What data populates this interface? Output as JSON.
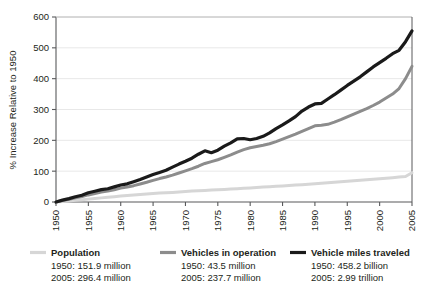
{
  "chart_data": {
    "type": "line",
    "title": "",
    "xlabel": "",
    "ylabel": "% Increase Relative to 1950",
    "xlim": [
      1950,
      2005
    ],
    "ylim": [
      0,
      600
    ],
    "ytick_values": [
      0,
      100,
      200,
      300,
      400,
      500,
      600
    ],
    "ytick_labels": [
      "0",
      "100",
      "200",
      "300",
      "400",
      "500",
      "600"
    ],
    "xtick_values": [
      1950,
      1955,
      1960,
      1965,
      1970,
      1975,
      1980,
      1985,
      1990,
      1995,
      2000,
      2005
    ],
    "xtick_labels": [
      "1950",
      "1955",
      "1960",
      "1965",
      "1970",
      "1975",
      "1980",
      "1985",
      "1990",
      "1995",
      "2000",
      "2005"
    ],
    "grid": "horizontal",
    "grid_color": "#e8e8e8",
    "legend_position": "below",
    "series": [
      {
        "name": "Population",
        "color": "#d6d6d6",
        "width": 3.0,
        "baseline_1950": "1950: 151.9 million",
        "final_2005": "2005: 296.4 million",
        "x": [
          1950,
          1951,
          1952,
          1953,
          1954,
          1955,
          1956,
          1957,
          1958,
          1959,
          1960,
          1961,
          1962,
          1963,
          1964,
          1965,
          1966,
          1967,
          1968,
          1969,
          1970,
          1971,
          1972,
          1973,
          1974,
          1975,
          1976,
          1977,
          1978,
          1979,
          1980,
          1981,
          1982,
          1983,
          1984,
          1985,
          1986,
          1987,
          1988,
          1989,
          1990,
          1991,
          1992,
          1993,
          1994,
          1995,
          1996,
          1997,
          1998,
          1999,
          2000,
          2001,
          2002,
          2003,
          2004,
          2005
        ],
        "values": [
          0,
          1.8,
          3.6,
          5.4,
          7.3,
          9.3,
          11.3,
          13.4,
          15.4,
          17.3,
          19.3,
          21.2,
          22.9,
          24.5,
          26.1,
          27.5,
          28.8,
          30.0,
          31.2,
          32.4,
          33.8,
          35.3,
          36.5,
          37.6,
          38.6,
          39.7,
          40.8,
          41.9,
          43.1,
          44.4,
          45.8,
          47.1,
          48.3,
          49.5,
          50.7,
          52.0,
          53.4,
          54.8,
          56.2,
          57.7,
          59.3,
          60.9,
          62.6,
          64.3,
          65.9,
          67.4,
          68.9,
          70.5,
          72.1,
          73.7,
          75.6,
          77.3,
          79.0,
          80.8,
          82.7,
          95.1
        ]
      },
      {
        "name": "Vehicles in operation",
        "color": "#8c8c8c",
        "width": 3.0,
        "baseline_1950": "1950: 43.5 million",
        "final_2005": "2005: 237.7 million",
        "x": [
          1950,
          1951,
          1952,
          1953,
          1954,
          1955,
          1956,
          1957,
          1958,
          1959,
          1960,
          1961,
          1962,
          1963,
          1964,
          1965,
          1966,
          1967,
          1968,
          1969,
          1970,
          1971,
          1972,
          1973,
          1974,
          1975,
          1976,
          1977,
          1978,
          1979,
          1980,
          1981,
          1982,
          1983,
          1984,
          1985,
          1986,
          1987,
          1988,
          1989,
          1990,
          1991,
          1992,
          1993,
          1994,
          1995,
          1996,
          1997,
          1998,
          1999,
          2000,
          2001,
          2002,
          2003,
          2004,
          2005
        ],
        "values": [
          0,
          5.0,
          9.0,
          13.5,
          17.5,
          23.0,
          27.5,
          32.0,
          35.5,
          40.0,
          45.0,
          48.5,
          53.0,
          58.5,
          64.0,
          70.0,
          76.0,
          81.0,
          87.0,
          94.0,
          101.0,
          108.0,
          116.0,
          125.0,
          131.0,
          137.0,
          145.0,
          153.0,
          162.0,
          170.0,
          176.0,
          180.0,
          184.0,
          189.0,
          196.0,
          204.0,
          212.0,
          220.0,
          229.0,
          238.0,
          247.0,
          249.0,
          252.0,
          259.0,
          267.0,
          276.0,
          285.0,
          294.0,
          303.0,
          313.0,
          324.0,
          337.0,
          350.0,
          368.0,
          400.0,
          440.0
        ]
      },
      {
        "name": "Vehicle miles traveled",
        "color": "#1a1a1a",
        "width": 3.2,
        "baseline_1950": "1950: 458.2 billion",
        "final_2005": "2005: 2.99 trillion",
        "x": [
          1950,
          1951,
          1952,
          1953,
          1954,
          1955,
          1956,
          1957,
          1958,
          1959,
          1960,
          1961,
          1962,
          1963,
          1964,
          1965,
          1966,
          1967,
          1968,
          1969,
          1970,
          1971,
          1972,
          1973,
          1974,
          1975,
          1976,
          1977,
          1978,
          1979,
          1980,
          1981,
          1982,
          1983,
          1984,
          1985,
          1986,
          1987,
          1988,
          1989,
          1990,
          1991,
          1992,
          1993,
          1994,
          1995,
          1996,
          1997,
          1998,
          1999,
          2000,
          2001,
          2002,
          2003,
          2004,
          2005
        ],
        "values": [
          0,
          6.0,
          11.0,
          17.0,
          22.0,
          30.0,
          35.0,
          40.0,
          43.0,
          49.0,
          55.0,
          59.0,
          66.0,
          73.0,
          81.0,
          89.0,
          96.0,
          103.0,
          113.0,
          123.0,
          132.0,
          142.0,
          155.0,
          166.0,
          160.0,
          168.0,
          181.0,
          192.0,
          205.0,
          206.0,
          202.0,
          206.0,
          213.0,
          224.0,
          238.0,
          250.0,
          263.0,
          277.0,
          295.0,
          308.0,
          318.0,
          320.0,
          334.0,
          348.0,
          363.0,
          378.0,
          392.0,
          406.0,
          422.0,
          438.0,
          452.0,
          466.0,
          481.0,
          492.0,
          520.0,
          555.0
        ]
      }
    ]
  },
  "axis": {
    "ylabel": "% Increase Relative to 1950"
  },
  "legend": [
    {
      "name": "Population",
      "line1": "1950: 151.9 million",
      "line2": "2005: 296.4 million",
      "color": "#d6d6d6"
    },
    {
      "name": "Vehicles in operation",
      "line1": "1950: 43.5 million",
      "line2": "2005: 237.7 million",
      "color": "#8c8c8c"
    },
    {
      "name": "Vehicle miles traveled",
      "line1": "1950: 458.2 billion",
      "line2": "2005: 2.99 trillion",
      "color": "#1a1a1a"
    }
  ]
}
